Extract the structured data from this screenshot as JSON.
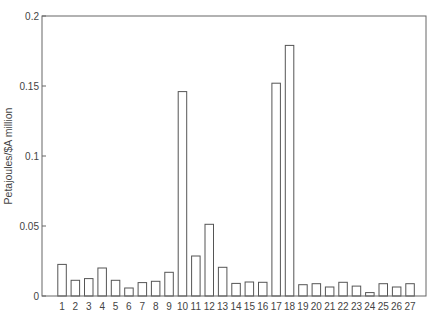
{
  "chart_data": {
    "type": "bar",
    "title": "",
    "xlabel": "",
    "ylabel": "Petajoules/$A million",
    "ylim": [
      0,
      0.2
    ],
    "yticks": [
      0,
      0.05,
      0.1,
      0.15,
      0.2
    ],
    "ytick_labels": [
      "0",
      "0.05",
      "0.1",
      "0.15",
      "0.2"
    ],
    "grid": false,
    "legend": null,
    "categories": [
      "1",
      "2",
      "3",
      "4",
      "5",
      "6",
      "7",
      "8",
      "9",
      "10",
      "11",
      "12",
      "13",
      "14",
      "15",
      "16",
      "17",
      "18",
      "19",
      "20",
      "21",
      "22",
      "23",
      "24",
      "25",
      "26",
      "27"
    ],
    "values": [
      0.0226,
      0.0112,
      0.0124,
      0.02,
      0.0112,
      0.0057,
      0.0096,
      0.0105,
      0.0169,
      0.146,
      0.0286,
      0.0512,
      0.0205,
      0.009,
      0.01,
      0.0098,
      0.152,
      0.179,
      0.0081,
      0.0088,
      0.0064,
      0.0098,
      0.0071,
      0.0024,
      0.0088,
      0.0064,
      0.0088
    ],
    "style": {
      "bar_fill": "#ffffff",
      "bar_stroke": "#555555",
      "axis_color": "#666666"
    }
  }
}
